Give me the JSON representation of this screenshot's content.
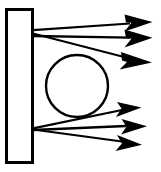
{
  "figure": {
    "title": "",
    "background_color": "#ffffff",
    "stroke_color": "#000000",
    "width": 161,
    "height": 172
  },
  "shapes": {
    "wall": {
      "name": "vertical-rectangle",
      "x": 6.5,
      "y": 9.5,
      "width": 26,
      "height": 153,
      "stroke_width": 3,
      "fill": "none"
    },
    "circle": {
      "name": "circle",
      "cx": 77,
      "cy": 86,
      "r": 31,
      "stroke_width": 2.4,
      "fill": "none"
    }
  },
  "rays": {
    "upper_origin": {
      "x": 33,
      "y": 32
    },
    "lower_origin": {
      "x": 33,
      "y": 129
    },
    "stroke_width": 2.2,
    "items": [
      {
        "name": "ray-1",
        "group": "upper",
        "x1": 33,
        "y1": 30,
        "x2": 143,
        "y2": 22,
        "head": "barbed"
      },
      {
        "name": "ray-2",
        "group": "upper",
        "x1": 33,
        "y1": 36,
        "x2": 143,
        "y2": 38,
        "head": "barbed"
      },
      {
        "name": "ray-3",
        "group": "upper",
        "x1": 33,
        "y1": 34,
        "x2": 143,
        "y2": 62,
        "head": "barbed"
      },
      {
        "name": "ray-4",
        "group": "lower",
        "x1": 33,
        "y1": 128,
        "x2": 137,
        "y2": 107,
        "head": "triangle"
      },
      {
        "name": "ray-5",
        "group": "lower",
        "x1": 33,
        "y1": 130,
        "x2": 141,
        "y2": 126,
        "head": "triangle"
      },
      {
        "name": "ray-6",
        "group": "lower",
        "x1": 33,
        "y1": 129,
        "x2": 137,
        "y2": 145,
        "head": "triangle"
      }
    ]
  },
  "chart_data": {
    "type": "diagram",
    "title": "",
    "elements": [
      {
        "kind": "rectangle",
        "label": "wall"
      },
      {
        "kind": "circle",
        "label": "sphere"
      },
      {
        "kind": "arrow",
        "label": "ray",
        "count": 6
      }
    ]
  }
}
